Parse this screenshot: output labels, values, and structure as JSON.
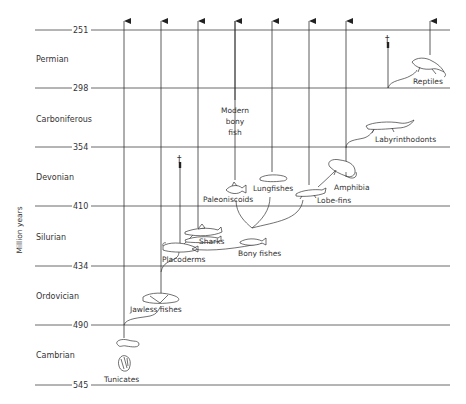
{
  "axis_label": "Million years",
  "boundaries": [
    {
      "value": "251"
    },
    {
      "value": "298"
    },
    {
      "value": "354"
    },
    {
      "value": "410"
    },
    {
      "value": "434"
    },
    {
      "value": "490"
    },
    {
      "value": "545"
    }
  ],
  "periods": [
    {
      "name": "Permian"
    },
    {
      "name": "Carboniferous"
    },
    {
      "name": "Devonian"
    },
    {
      "name": "Silurian"
    },
    {
      "name": "Ordovician"
    },
    {
      "name": "Cambrian"
    }
  ],
  "groups": {
    "tunicates": "Tunicates",
    "jawless_fishes": "Jawless fishes",
    "placoderms": "Placoderms",
    "sharks": "Sharks",
    "bony_fishes": "Bony fishes",
    "paleoniscoids": "Paleoniscoids",
    "modern_bony_fish_line1": "Modern",
    "modern_bony_fish_line2": "bony",
    "modern_bony_fish_line3": "fish",
    "lungfishes": "Lungfishes",
    "lobe_fins": "Lobe-fins",
    "amphibia": "Amphibia",
    "labyrinthodonts": "Labyrinthodonts",
    "reptiles": "Reptiles"
  },
  "extinction_marker": "†"
}
